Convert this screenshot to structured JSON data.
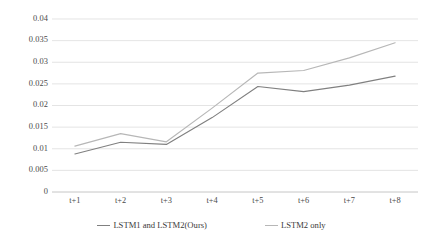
{
  "chart_data": {
    "type": "line",
    "title": "",
    "subtitle": "",
    "xlabel": "",
    "ylabel": "",
    "categories": [
      "t+1",
      "t+2",
      "t+3",
      "t+4",
      "t+5",
      "t+6",
      "t+7",
      "t+8"
    ],
    "series": [
      {
        "name": "LSTM1 and LSTM2(Ours)",
        "color": "#808080",
        "values": [
          0.0088,
          0.0115,
          0.011,
          0.0172,
          0.0244,
          0.0232,
          0.0247,
          0.0268
        ]
      },
      {
        "name": "LSTM2 only",
        "color": "#b7b7b7",
        "values": [
          0.0106,
          0.0135,
          0.0116,
          0.0194,
          0.0275,
          0.0281,
          0.031,
          0.0345
        ]
      }
    ],
    "ylim": [
      0,
      0.04
    ],
    "yticks": [
      0,
      0.005,
      0.01,
      0.015,
      0.02,
      0.025,
      0.03,
      0.035,
      0.04
    ],
    "ytick_labels": [
      "0",
      "0.005",
      "0.01",
      "0.015",
      "0.02",
      "0.025",
      "0.03",
      "0.035",
      "0.04"
    ],
    "grid": true,
    "grid_axis": "y",
    "grid_color": "#d9d9d9",
    "legend_position": "bottom",
    "axis_line_color": "#bfbfbf",
    "background": "#ffffff"
  },
  "legend": {
    "entries": [
      {
        "label": "LSTM1 and LSTM2(Ours)",
        "color": "#808080"
      },
      {
        "label": "LSTM2 only",
        "color": "#b7b7b7"
      }
    ]
  }
}
